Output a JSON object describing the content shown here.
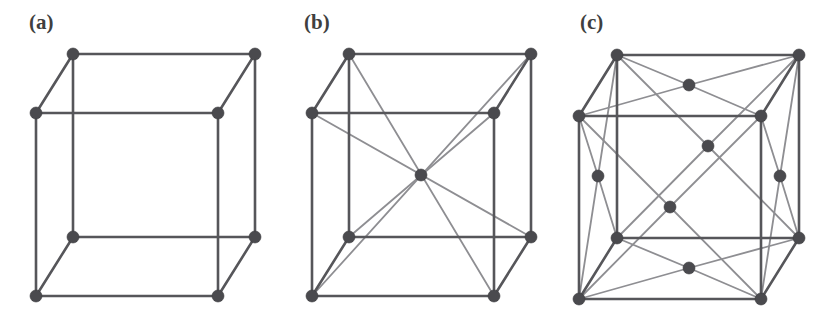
{
  "figure": {
    "background_color": "#ffffff",
    "width": 829,
    "height": 318,
    "edge_color": "#56565a",
    "diagonal_color": "#8e8e92",
    "atom_color": "#4a4a4e",
    "atom_radius": 6.0,
    "edge_width": 2.6,
    "diagonal_width": 1.8
  },
  "panels": [
    {
      "id": "a",
      "label": "(a)",
      "name": "simple-cubic",
      "origin_x": 0,
      "geometry": {
        "front_left_x": 36,
        "front_right_x": 218,
        "front_top_y": 113,
        "front_bottom_y": 296,
        "depth_dx": 37,
        "depth_dy": -59
      },
      "atoms": [
        {
          "name": "front-bottom-left",
          "x": 36,
          "y": 296
        },
        {
          "name": "front-bottom-right",
          "x": 218,
          "y": 296
        },
        {
          "name": "front-top-right",
          "x": 218,
          "y": 113
        },
        {
          "name": "front-top-left",
          "x": 36,
          "y": 113
        },
        {
          "name": "back-bottom-left",
          "x": 73,
          "y": 237
        },
        {
          "name": "back-bottom-right",
          "x": 255,
          "y": 237
        },
        {
          "name": "back-top-right",
          "x": 255,
          "y": 54
        },
        {
          "name": "back-top-left",
          "x": 73,
          "y": 54
        }
      ],
      "edges": [
        [
          0,
          1
        ],
        [
          1,
          2
        ],
        [
          2,
          3
        ],
        [
          3,
          0
        ],
        [
          4,
          5
        ],
        [
          5,
          6
        ],
        [
          6,
          7
        ],
        [
          7,
          4
        ],
        [
          0,
          4
        ],
        [
          1,
          5
        ],
        [
          2,
          6
        ],
        [
          3,
          7
        ]
      ],
      "diagonals": [],
      "atom_count": 8,
      "interior_atoms": 0
    },
    {
      "id": "b",
      "label": "(b)",
      "name": "body-centered-cubic",
      "origin_x": 276,
      "geometry": {
        "front_left_x": 36,
        "front_right_x": 218,
        "front_top_y": 113,
        "front_bottom_y": 296,
        "depth_dx": 37,
        "depth_dy": -59
      },
      "atoms": [
        {
          "name": "front-bottom-left",
          "x": 36,
          "y": 296
        },
        {
          "name": "front-bottom-right",
          "x": 218,
          "y": 296
        },
        {
          "name": "front-top-right",
          "x": 218,
          "y": 113
        },
        {
          "name": "front-top-left",
          "x": 36,
          "y": 113
        },
        {
          "name": "back-bottom-left",
          "x": 73,
          "y": 237
        },
        {
          "name": "back-bottom-right",
          "x": 255,
          "y": 237
        },
        {
          "name": "back-top-right",
          "x": 255,
          "y": 54
        },
        {
          "name": "back-top-left",
          "x": 73,
          "y": 54
        },
        {
          "name": "body-center",
          "x": 145,
          "y": 175
        }
      ],
      "edges": [
        [
          0,
          1
        ],
        [
          1,
          2
        ],
        [
          2,
          3
        ],
        [
          3,
          0
        ],
        [
          4,
          5
        ],
        [
          5,
          6
        ],
        [
          6,
          7
        ],
        [
          7,
          4
        ],
        [
          0,
          4
        ],
        [
          1,
          5
        ],
        [
          2,
          6
        ],
        [
          3,
          7
        ]
      ],
      "diagonals": [
        [
          0,
          6
        ],
        [
          1,
          7
        ],
        [
          2,
          4
        ],
        [
          3,
          5
        ]
      ],
      "atom_count": 9,
      "interior_atoms": 1
    },
    {
      "id": "c",
      "label": "(c)",
      "name": "face-centered-cubic",
      "origin_x": 553,
      "geometry": {
        "front_left_x": 26,
        "front_right_x": 208,
        "front_top_y": 116,
        "front_bottom_y": 299,
        "depth_dx": 38,
        "depth_dy": -61
      },
      "atoms": [
        {
          "name": "front-bottom-left",
          "x": 26,
          "y": 299
        },
        {
          "name": "front-bottom-right",
          "x": 208,
          "y": 299
        },
        {
          "name": "front-top-right",
          "x": 208,
          "y": 116
        },
        {
          "name": "front-top-left",
          "x": 26,
          "y": 116
        },
        {
          "name": "back-bottom-left",
          "x": 64,
          "y": 238
        },
        {
          "name": "back-bottom-right",
          "x": 246,
          "y": 238
        },
        {
          "name": "back-top-right",
          "x": 246,
          "y": 55
        },
        {
          "name": "back-top-left",
          "x": 64,
          "y": 55
        },
        {
          "name": "face-center-front",
          "x": 117,
          "y": 207
        },
        {
          "name": "face-center-back",
          "x": 155,
          "y": 146
        },
        {
          "name": "face-center-left",
          "x": 45,
          "y": 176
        },
        {
          "name": "face-center-right",
          "x": 227,
          "y": 176
        },
        {
          "name": "face-center-top",
          "x": 136,
          "y": 85
        },
        {
          "name": "face-center-bottom",
          "x": 136,
          "y": 268
        }
      ],
      "edges": [
        [
          0,
          1
        ],
        [
          1,
          2
        ],
        [
          2,
          3
        ],
        [
          3,
          0
        ],
        [
          4,
          5
        ],
        [
          5,
          6
        ],
        [
          6,
          7
        ],
        [
          7,
          4
        ],
        [
          0,
          4
        ],
        [
          1,
          5
        ],
        [
          2,
          6
        ],
        [
          3,
          7
        ]
      ],
      "diagonals": [
        [
          0,
          8
        ],
        [
          1,
          8
        ],
        [
          2,
          8
        ],
        [
          3,
          8
        ],
        [
          4,
          9
        ],
        [
          5,
          9
        ],
        [
          6,
          9
        ],
        [
          7,
          9
        ],
        [
          0,
          10
        ],
        [
          3,
          10
        ],
        [
          4,
          10
        ],
        [
          7,
          10
        ],
        [
          1,
          11
        ],
        [
          2,
          11
        ],
        [
          5,
          11
        ],
        [
          6,
          11
        ],
        [
          2,
          12
        ],
        [
          3,
          12
        ],
        [
          6,
          12
        ],
        [
          7,
          12
        ],
        [
          0,
          13
        ],
        [
          1,
          13
        ],
        [
          4,
          13
        ],
        [
          5,
          13
        ]
      ],
      "atom_count": 14,
      "interior_atoms": 0,
      "face_atoms": 6
    }
  ]
}
